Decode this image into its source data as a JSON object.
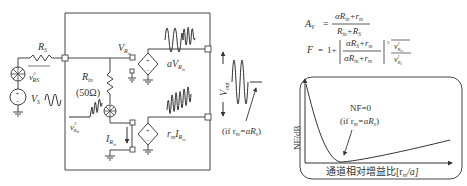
{
  "circuit": {
    "source": {
      "rs_label": "R",
      "rs_sub": "S",
      "noise_label": "v",
      "noise_sup": "2",
      "noise_sub": "RS",
      "vs_label": "V",
      "vs_sub": "S"
    },
    "input": {
      "rin_label": "R",
      "rin_sub": "in",
      "rin_value": "(50Ω)",
      "noise_label": "v",
      "noise_sup": "2",
      "noise_sub": "R",
      "noise_subsub": "in",
      "vrin_label": "V",
      "vrin_sub": "R",
      "vrin_subsub": "in",
      "irin_label": "I",
      "irin_sub": "R",
      "irin_subsub": "in"
    },
    "sources": {
      "voltage_gain_label": "aV",
      "voltage_gain_sub": "R",
      "voltage_gain_subsub": "in",
      "transres_label": "r",
      "transres_sub": "m",
      "transres_i": "I",
      "transres_i_sub": "R",
      "transres_i_subsub": "in"
    },
    "output": {
      "vout_label": "V",
      "vout_sub": "out",
      "condition": "(if r",
      "condition_sub": "m",
      "condition_rest": "=aR",
      "condition_sub2": "s",
      "condition_close": ")"
    }
  },
  "equations": {
    "av_lhs": "A",
    "av_lhs_sub": "V",
    "av_num": "αR",
    "av_num_sub": "in",
    "av_num_rest": "+r",
    "av_num_sub2": "m",
    "av_den": "R",
    "av_den_sub": "in",
    "av_den_rest": "+R",
    "av_den_sub2": "S",
    "f_lhs": "F",
    "f_eq": "=",
    "f_one": "1+",
    "f_num": "αR",
    "f_num_sub": "S",
    "f_num_rest": "+r",
    "f_num_sub2": "m",
    "f_den": "αR",
    "f_den_sub": "in",
    "f_den_rest": "+r",
    "f_den_sub2": "m",
    "f_exp": "2",
    "f_ratio_num": "v",
    "f_ratio_num_sub": "R",
    "f_ratio_num_subsub": "in",
    "f_ratio_den": "v",
    "f_ratio_den_sub": "R",
    "f_ratio_den_subsub": "S"
  },
  "plot": {
    "ylabel": "NF/dB",
    "xlabel_cn": "通道相对增益比[r",
    "xlabel_sub": "m",
    "xlabel_rest": "/a]",
    "annotation_title": "NF=0",
    "annotation_cond": "(if r",
    "annotation_sub": "m",
    "annotation_rest": "=aR",
    "annotation_sub2": "s",
    "annotation_close": ")"
  }
}
